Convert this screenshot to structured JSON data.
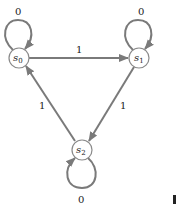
{
  "diagram": {
    "type": "finite-state-machine",
    "colors": {
      "edge": "#7a7a7a",
      "node_stroke": "#8a8a8a",
      "text": "#222222"
    },
    "nodes": [
      {
        "id": "s0",
        "base": "s",
        "sub": "0",
        "x": 19,
        "y": 58
      },
      {
        "id": "s1",
        "base": "s",
        "sub": "1",
        "x": 139,
        "y": 58
      },
      {
        "id": "s2",
        "base": "s",
        "sub": "2",
        "x": 82,
        "y": 150
      }
    ],
    "edges": [
      {
        "from": "s0",
        "to": "s0",
        "label": "0"
      },
      {
        "from": "s1",
        "to": "s1",
        "label": "0"
      },
      {
        "from": "s2",
        "to": "s2",
        "label": "0"
      },
      {
        "from": "s0",
        "to": "s1",
        "label": "1"
      },
      {
        "from": "s1",
        "to": "s2",
        "label": "1"
      },
      {
        "from": "s2",
        "to": "s0",
        "label": "1"
      }
    ]
  }
}
